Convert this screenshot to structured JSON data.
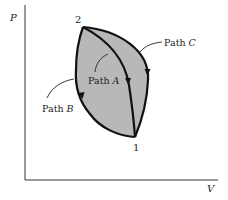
{
  "diagram": {
    "type": "pv-diagram",
    "axes": {
      "y_label": "P",
      "x_label": "V"
    },
    "points": [
      {
        "id": "2",
        "label": "2"
      },
      {
        "id": "1",
        "label": "1"
      }
    ],
    "paths": [
      {
        "id": "A",
        "label_prefix": "Path ",
        "label_var": "A",
        "from": "2",
        "to": "1",
        "direction": "2 to 1"
      },
      {
        "id": "B",
        "label_prefix": "Path ",
        "label_var": "B",
        "from": "2",
        "to": "1",
        "direction": "2 to 1"
      },
      {
        "id": "C",
        "label_prefix": "Path ",
        "label_var": "C",
        "from": "2",
        "to": "1",
        "direction": "2 to 1"
      }
    ],
    "colors": {
      "fill": "#b8b8b8",
      "stroke": "#111111",
      "axis": "#333333",
      "background": "#ffffff"
    }
  }
}
